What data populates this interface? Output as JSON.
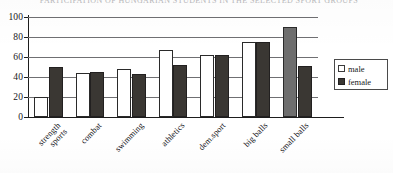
{
  "chart_data": {
    "type": "bar",
    "title": "PARTICIPATION OF HUNGARIAN  STUDENTS  IN THE SELECTED SPORT GROUPS",
    "xlabel": "",
    "ylabel": "",
    "ylim": [
      0,
      100
    ],
    "yticks": [
      0,
      20,
      40,
      60,
      80,
      100
    ],
    "grid": true,
    "legend_position": "right",
    "categories": [
      "strength\nsports",
      "combat",
      "swimming",
      "athletics",
      "dem.sport",
      "big balls",
      "small balls"
    ],
    "series": [
      {
        "name": "male",
        "color": "#ffffff",
        "values": [
          20,
          44,
          48,
          67,
          62,
          75,
          90
        ]
      },
      {
        "name": "female",
        "color": "#3a3733",
        "values": [
          50,
          45,
          43,
          52,
          62,
          75,
          51
        ]
      }
    ]
  },
  "legend": {
    "items": [
      {
        "label": "male"
      },
      {
        "label": "female"
      }
    ]
  },
  "axis": {
    "y_tick_labels": [
      "0",
      "20",
      "40",
      "60",
      "80",
      "100"
    ]
  }
}
